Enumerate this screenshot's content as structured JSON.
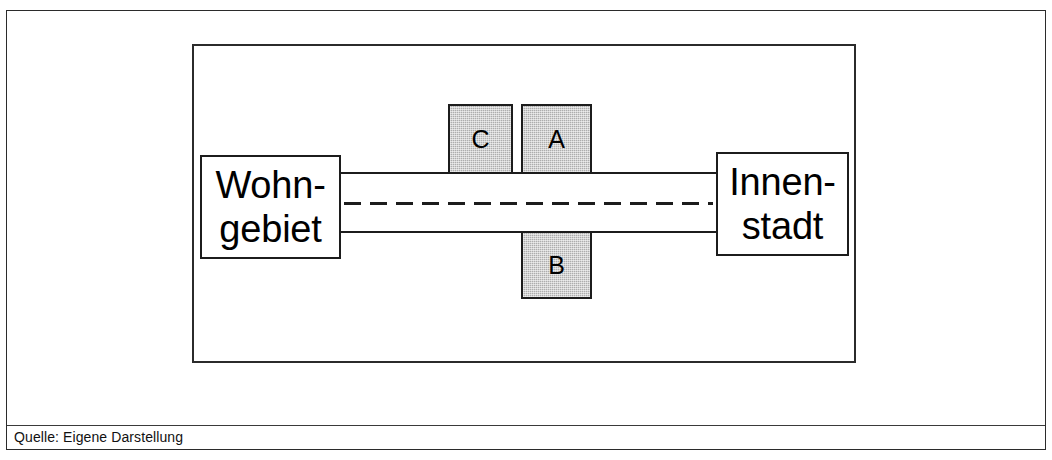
{
  "figure": {
    "caption": "Quelle: Eigene Darstellung"
  },
  "diagram": {
    "nodes": [
      {
        "id": "wohngebiet",
        "label_line1": "Wohn-",
        "label_line2": "gebiet",
        "shape": "rectangle",
        "fill": "#ffffff"
      },
      {
        "id": "innenstadt",
        "label_line1": "Innen-",
        "label_line2": "stadt",
        "shape": "rectangle",
        "fill": "#ffffff"
      }
    ],
    "blocks": [
      {
        "id": "c",
        "label": "C",
        "position": "above-road",
        "fill": "#adadad"
      },
      {
        "id": "a",
        "label": "A",
        "position": "above-road",
        "fill": "#adadad"
      },
      {
        "id": "b",
        "label": "B",
        "position": "below-road",
        "fill": "#adadad"
      }
    ],
    "road": {
      "edge_style": "solid",
      "center_style": "dashed",
      "color": "#1c1c1c"
    }
  }
}
